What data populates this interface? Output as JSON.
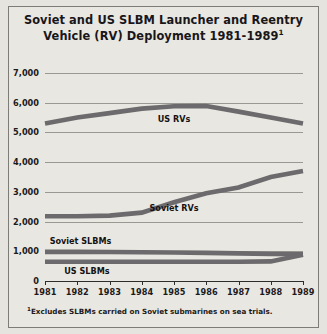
{
  "figure": {
    "title_line1": "Soviet and US SLBM Launcher and Reentry",
    "title_line2": "Vehicle (RV) Deployment 1981-1989",
    "title_footnote_marker": "1",
    "footnote_marker": "1",
    "footnote_text": "Excludes SLBMs carried on Soviet submarines on sea trials.",
    "background_color": "#e9e7e1",
    "series_color": "#6c6a6c",
    "axis_color": "#2e2c2c",
    "grid_color": "#9b9892"
  },
  "chart_data": {
    "type": "line",
    "title": "Soviet and US SLBM Launcher and Reentry Vehicle (RV) Deployment 1981-1989",
    "xlabel": "",
    "ylabel": "",
    "x": [
      1981,
      1982,
      1983,
      1984,
      1985,
      1986,
      1987,
      1988,
      1989
    ],
    "categories": [
      "1981",
      "1982",
      "1983",
      "1984",
      "1985",
      "1986",
      "1987",
      "1988",
      "1989"
    ],
    "ylim": [
      0,
      7000
    ],
    "yticks": [
      0,
      1000,
      2000,
      3000,
      4000,
      5000,
      6000,
      7000
    ],
    "ytick_labels": [
      "0",
      "1,000",
      "2,000",
      "3,000",
      "4,000",
      "5,000",
      "6,000",
      "7,000"
    ],
    "grid": true,
    "legend": "inline-labels",
    "series": [
      {
        "name": "US RVs",
        "label": "US RVs",
        "values": [
          5300,
          5500,
          5650,
          5800,
          5880,
          5890,
          5700,
          5500,
          5300
        ],
        "label_x": 1985,
        "label_y": 5450
      },
      {
        "name": "Soviet RVs",
        "label": "Soviet RVs",
        "values": [
          2180,
          2180,
          2200,
          2300,
          2650,
          2950,
          3150,
          3500,
          3700
        ],
        "label_x": 1985,
        "label_y": 2450
      },
      {
        "name": "Soviet SLBMs",
        "label": "Soviet SLBMs",
        "values": [
          980,
          980,
          975,
          970,
          960,
          945,
          930,
          910,
          900
        ],
        "label_x": 1982.1,
        "label_y": 1330
      },
      {
        "name": "US SLBMs",
        "label": "US SLBMs",
        "values": [
          650,
          650,
          650,
          650,
          650,
          650,
          650,
          660,
          880
        ],
        "label_x": 1982.3,
        "label_y": 330
      }
    ]
  }
}
